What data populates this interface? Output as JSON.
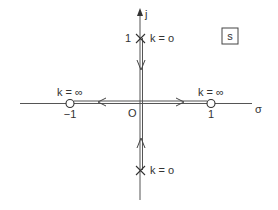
{
  "diagram": {
    "type": "root-locus",
    "plane_label": "s",
    "axes": {
      "real_label": "σ",
      "imag_label": "j",
      "origin_label": "O"
    },
    "poles": [
      {
        "id": "upper",
        "tick_label": "1",
        "gain_label": "k = o"
      },
      {
        "id": "lower",
        "gain_label": "k = o"
      }
    ],
    "zeros": [
      {
        "id": "left",
        "tick_label": "−1",
        "gain_label": "k = ∞"
      },
      {
        "id": "right",
        "tick_label": "1",
        "gain_label": "k = ∞"
      }
    ],
    "colors": {
      "line": "#444444",
      "text": "#333333",
      "background": "#ffffff"
    }
  }
}
